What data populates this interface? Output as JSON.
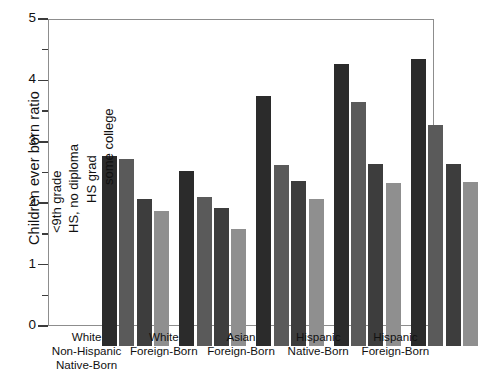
{
  "chart_data": {
    "type": "bar",
    "title": "",
    "xlabel": "",
    "ylabel": "Children ever born ratio",
    "ylim": [
      0,
      5
    ],
    "ytick_labels": [
      "0",
      "1",
      "2",
      "3",
      "4",
      "5"
    ],
    "yticks": [
      0,
      1,
      2,
      3,
      4,
      5
    ],
    "yminor_ticks": [
      0.5,
      1.5,
      2.5,
      3.5,
      4.5
    ],
    "grid": false,
    "legend_position": "inside-plot-left-rotated",
    "categories": [
      "White Non-Hispanic Native-Born",
      "White Foreign-Born",
      "Asian Foreign-Born",
      "Hispanic Native-Born",
      "Hispanic Foreign-Born"
    ],
    "category_lines": [
      [
        "White",
        "Non-Hispanic",
        "Native-Born"
      ],
      [
        "White",
        "Foreign-Born"
      ],
      [
        "Asian",
        "Foreign-Born"
      ],
      [
        "Hispanic",
        "Native-Born"
      ],
      [
        "Hispanic",
        "Foreign-Born"
      ]
    ],
    "series": [
      {
        "name": "<9th grade",
        "color": "#2b2b2b",
        "values": [
          3.1,
          2.85,
          4.07,
          4.6,
          4.68
        ]
      },
      {
        "name": "HS, no diploma",
        "color": "#5a5a5a",
        "values": [
          3.05,
          2.42,
          2.95,
          3.97,
          3.6
        ]
      },
      {
        "name": "HS grad",
        "color": "#3d3d3d",
        "values": [
          2.4,
          2.25,
          2.68,
          2.97,
          2.97
        ]
      },
      {
        "name": "some college",
        "color": "#8f8f8f",
        "values": [
          2.2,
          1.9,
          2.4,
          2.65,
          2.67
        ]
      }
    ]
  },
  "colors": {
    "axis": "#8d8d8d",
    "tick": "#3b3b3b",
    "text": "#111111",
    "background": "#ffffff"
  }
}
